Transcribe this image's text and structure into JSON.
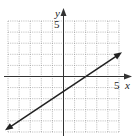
{
  "graph": {
    "x_axis_label": "x",
    "y_axis_label": "y",
    "x_tick_label": "5",
    "y_tick_label": "5",
    "grid": {
      "xmin": -5,
      "xmax": 5,
      "ymin": -5,
      "ymax": 5,
      "step": 1
    },
    "colors": {
      "grid": "#9a9a9a",
      "axis": "#333333",
      "line": "#222222"
    }
  },
  "chart_data": {
    "type": "line",
    "title": "",
    "xlabel": "x",
    "ylabel": "y",
    "xlim": [
      -5,
      5
    ],
    "ylim": [
      -5,
      5
    ],
    "grid": true,
    "tick_labels": {
      "x": [
        "5"
      ],
      "y": [
        "5"
      ]
    },
    "series": [
      {
        "name": "2x - 3y = 4",
        "equation": "y = (2/3)x - 4/3",
        "x_intercept": 2,
        "y_intercept": -1.333,
        "points": [
          [
            -5,
            -4.67
          ],
          [
            -1,
            -2
          ],
          [
            2,
            0
          ],
          [
            5,
            2
          ]
        ],
        "arrows": "both"
      }
    ]
  }
}
